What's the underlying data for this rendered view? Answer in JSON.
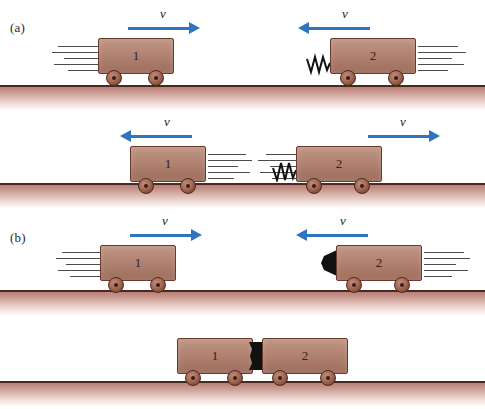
{
  "figure": {
    "type": "physics-diagram",
    "background_color": "#ffffff",
    "cart_color": "#b07a66",
    "cart_outline_color": "#6a3b2c",
    "wheel_color": "#8a5140",
    "ground_line_color": "#4a2a20",
    "ground_fill_color": "#c99a90",
    "arrow_color": "#2f74c0",
    "speed_line_color": "#4c4c4c",
    "clay_color": "#111111",
    "spring_color": "#111111"
  },
  "panels": [
    {
      "label": "(a)",
      "name": "elastic-collision-panel",
      "rows": [
        {
          "name": "before-collision",
          "carts": [
            {
              "number": "1",
              "direction": "right",
              "velocity_label": "v",
              "has_spring": false,
              "has_clay": false,
              "speed_lines_side": "left"
            },
            {
              "number": "2",
              "direction": "left",
              "velocity_label": "v",
              "has_spring": true,
              "has_clay": false,
              "speed_lines_side": "right"
            }
          ]
        },
        {
          "name": "after-collision",
          "carts": [
            {
              "number": "1",
              "direction": "left",
              "velocity_label": "v",
              "has_spring": false,
              "has_clay": false,
              "speed_lines_side": "right"
            },
            {
              "number": "2",
              "direction": "right",
              "velocity_label": "v",
              "has_spring": true,
              "has_clay": false,
              "speed_lines_side": "left"
            }
          ]
        }
      ]
    },
    {
      "label": "(b)",
      "name": "inelastic-collision-panel",
      "rows": [
        {
          "name": "before-collision",
          "carts": [
            {
              "number": "1",
              "direction": "right",
              "velocity_label": "v",
              "has_spring": false,
              "has_clay": false,
              "speed_lines_side": "left"
            },
            {
              "number": "2",
              "direction": "left",
              "velocity_label": "v",
              "has_spring": false,
              "has_clay": true,
              "speed_lines_side": "right"
            }
          ]
        },
        {
          "name": "after-collision-stuck-together",
          "carts": [
            {
              "number": "1",
              "direction": "none",
              "velocity_label": "",
              "has_spring": false,
              "has_clay": false,
              "speed_lines_side": "none"
            },
            {
              "number": "2",
              "direction": "none",
              "velocity_label": "",
              "has_spring": false,
              "has_clay": true,
              "speed_lines_side": "none"
            }
          ]
        }
      ]
    }
  ]
}
